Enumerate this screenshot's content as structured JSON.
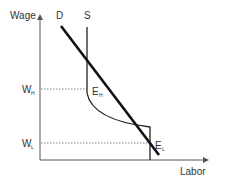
{
  "diagram": {
    "y_axis_label": "Wage",
    "x_axis_label": "Labor",
    "demand_label": "D",
    "supply_label": "S",
    "wage_high": {
      "main": "W",
      "sub": "H"
    },
    "wage_low": {
      "main": "W",
      "sub": "L"
    },
    "equilibrium_high": {
      "main": "E",
      "sub": "H"
    },
    "equilibrium_low": {
      "main": "E",
      "sub": "L"
    },
    "colors": {
      "axis": "#555555",
      "curve": "#111111",
      "dotted": "#666666",
      "text": "#333333"
    }
  }
}
